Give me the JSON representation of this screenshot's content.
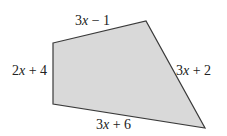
{
  "diagram": {
    "type": "quadrilateral",
    "fill": "#d9d9d9",
    "stroke": "#3a3a3a",
    "vertices": [
      [
        53,
        43
      ],
      [
        146,
        21
      ],
      [
        205,
        128
      ],
      [
        53,
        104
      ]
    ],
    "sides": [
      {
        "name": "top",
        "coef": "3",
        "var": "x",
        "rest": " − 1",
        "x": 75,
        "y": 25
      },
      {
        "name": "right",
        "coef": "3",
        "var": "x",
        "rest": " + 2",
        "x": 176,
        "y": 75
      },
      {
        "name": "bottom",
        "coef": "3",
        "var": "x",
        "rest": " + 6",
        "x": 96,
        "y": 129
      },
      {
        "name": "left",
        "coef": "2",
        "var": "x",
        "rest": " + 4",
        "x": 12,
        "y": 75
      }
    ]
  }
}
